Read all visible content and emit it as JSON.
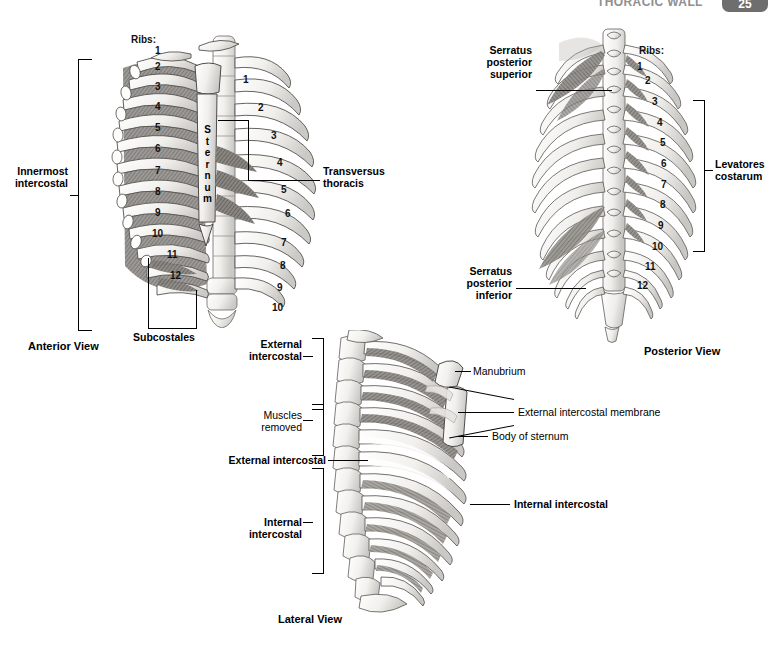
{
  "header": {
    "title": "THORACIC WALL",
    "page_number": "25"
  },
  "figures": {
    "anterior": {
      "caption": "Anterior View",
      "ribs_header": "Ribs:",
      "outer_rib_numbers": [
        "1",
        "2",
        "3",
        "4",
        "5",
        "6",
        "7",
        "8",
        "9",
        "10",
        "11",
        "12"
      ],
      "inner_rib_numbers": [
        "1",
        "2",
        "3",
        "4",
        "5",
        "6",
        "7",
        "8",
        "9",
        "10"
      ],
      "labels": {
        "innermost_intercostal": "Innermost\nintercostal",
        "sternum": "Sternum",
        "transversus_thoracis": "Transversus\nthoracis",
        "subcostales": "Subcostales"
      }
    },
    "posterior": {
      "caption": "Posterior View",
      "ribs_header": "Ribs:",
      "rib_numbers": [
        "1",
        "2",
        "3",
        "4",
        "5",
        "6",
        "7",
        "8",
        "9",
        "10",
        "11",
        "12"
      ],
      "labels": {
        "serratus_posterior_superior": "Serratus\nposterior\nsuperior",
        "serratus_posterior_inferior": "Serratus\nposterior\ninferior",
        "levatores_costarum": "Levatores\ncostarum"
      }
    },
    "lateral": {
      "caption": "Lateral View",
      "labels": {
        "external_intercostal_bracket": "External\nintercostal",
        "muscles_removed": "Muscles\nremoved",
        "external_intercostal_leader": "External intercostal",
        "internal_intercostal_bracket": "Internal\nintercostal",
        "manubrium": "Manubrium",
        "external_intercostal_membrane": "External intercostal membrane",
        "body_of_sternum": "Body of sternum",
        "internal_intercostal_leader": "Internal intercostal"
      }
    }
  },
  "colors": {
    "ink": "#000000",
    "bone_light": "#f2f1ef",
    "bone_shade": "#cfcdc9",
    "muscle_dark": "#6e6b67",
    "muscle_mid": "#9a9793",
    "header_grey": "#8f8f8f",
    "tab_grey": "#6e6e6e"
  }
}
